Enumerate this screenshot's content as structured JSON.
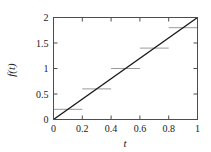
{
  "chart_data": {
    "type": "line",
    "title": "",
    "xlabel": "t",
    "ylabel": "f(t)",
    "xlim": [
      0,
      1
    ],
    "ylim": [
      0,
      2
    ],
    "grid": false,
    "legend": null,
    "xticks": [
      0,
      0.2,
      0.4,
      0.6,
      0.8,
      1
    ],
    "xticklabels": [
      "0",
      "0.2",
      "0.4",
      "0.6",
      "0.8",
      "1"
    ],
    "yticks": [
      0,
      0.5,
      1,
      1.5,
      2
    ],
    "yticklabels": [
      "0",
      "0.5",
      "1",
      "1.5",
      "2"
    ],
    "series": [
      {
        "name": "f(t) = 2t",
        "type": "line",
        "color": "#1a1a1a",
        "x": [
          0,
          1
        ],
        "values": [
          0,
          2
        ]
      },
      {
        "name": "piecewise-constant approximation",
        "type": "step",
        "color": "#9a9a9a",
        "intervals": [
          {
            "x_start": 0.0,
            "x_end": 0.2,
            "y": 0.2
          },
          {
            "x_start": 0.2,
            "x_end": 0.4,
            "y": 0.6
          },
          {
            "x_start": 0.4,
            "x_end": 0.6,
            "y": 1.0
          },
          {
            "x_start": 0.6,
            "x_end": 0.8,
            "y": 1.4
          },
          {
            "x_start": 0.8,
            "x_end": 1.0,
            "y": 1.8
          }
        ]
      }
    ]
  },
  "axes": {
    "x_axis_label": "t",
    "y_axis_label": "f(t)",
    "frame_color": "#4d4d4d"
  },
  "ticks": {
    "x": [
      {
        "value": 0,
        "label": "0"
      },
      {
        "value": 0.2,
        "label": "0.2"
      },
      {
        "value": 0.4,
        "label": "0.4"
      },
      {
        "value": 0.6,
        "label": "0.6"
      },
      {
        "value": 0.8,
        "label": "0.8"
      },
      {
        "value": 1,
        "label": "1"
      }
    ],
    "y": [
      {
        "value": 0,
        "label": "0"
      },
      {
        "value": 0.5,
        "label": "0.5"
      },
      {
        "value": 1,
        "label": "1"
      },
      {
        "value": 1.5,
        "label": "1.5"
      },
      {
        "value": 2,
        "label": "2"
      }
    ]
  }
}
